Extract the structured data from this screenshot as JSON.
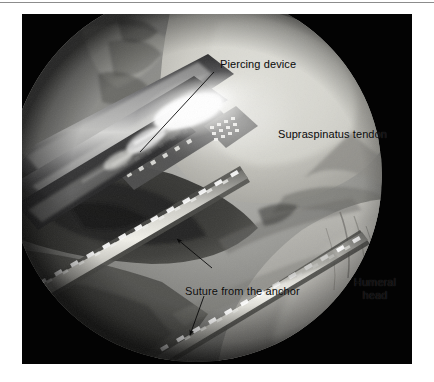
{
  "page": {
    "background_color": "#ffffff",
    "rule_color": "#8c8c8c"
  },
  "figure": {
    "kind": "arthroscopic-photograph",
    "plate_background": "#030303",
    "scope_circle": {
      "center_x": 196,
      "center_y": 176,
      "radius": 186
    },
    "annotations": [
      {
        "id": "piercing-device",
        "label": "Piercing device",
        "marker": "leader-line",
        "text_x": 198,
        "text_y": 44
      },
      {
        "id": "supraspinatus-tendon",
        "label": "Supraspinatus tendon",
        "marker": "none",
        "text_x": 256,
        "text_y": 114
      },
      {
        "id": "suture-from-the-anchor",
        "label": "Suture from the anchor",
        "marker": "two-arrows",
        "text_x": 163,
        "text_y": 271
      },
      {
        "id": "humeral-head",
        "label": "Humeral\nhead",
        "label_line_1": "Humeral",
        "label_line_2": "head",
        "marker": "none",
        "text_x": 324,
        "text_y": 262
      }
    ],
    "annotation_text_color": "#0a0a0a"
  }
}
